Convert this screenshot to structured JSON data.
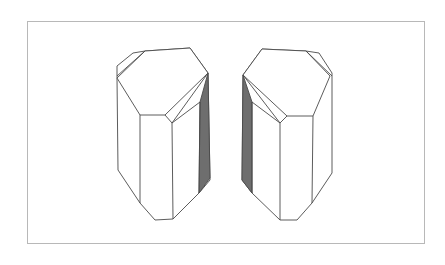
{
  "figure": {
    "frame_color": "#b8b8b8",
    "line_color": "#4a4a4a",
    "shade_color": "#6e6e6e"
  },
  "crystals": [
    {
      "name": "left-crystal",
      "shaded_side": "right"
    },
    {
      "name": "right-crystal",
      "shaded_side": "left"
    }
  ]
}
